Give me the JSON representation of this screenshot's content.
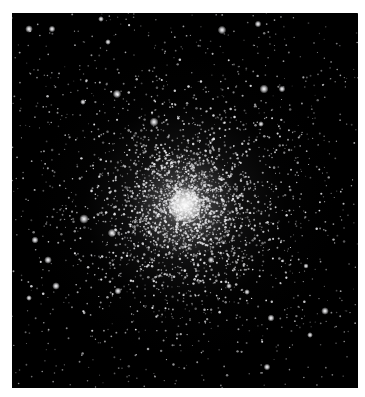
{
  "image": {
    "subject": "Globular star cluster",
    "description": "Dense spherical cluster of stars on a black sky, bright concentrated core with stars thinning toward the edges",
    "frame": {
      "x": 12,
      "y": 13,
      "width": 346,
      "height": 375
    },
    "background_color": "#ffffff",
    "sky_color": "#000000",
    "core_center": {
      "x": 185,
      "y": 205
    },
    "core_color": "#ffffff",
    "star_color": "#e8e8ea"
  },
  "bright_stars": [
    {
      "x": 29,
      "y": 29,
      "r": 1.6
    },
    {
      "x": 52,
      "y": 29,
      "r": 1.4
    },
    {
      "x": 101,
      "y": 19,
      "r": 1.2
    },
    {
      "x": 117,
      "y": 94,
      "r": 1.8
    },
    {
      "x": 108,
      "y": 42,
      "r": 1.2
    },
    {
      "x": 83,
      "y": 102,
      "r": 1.2
    },
    {
      "x": 154,
      "y": 122,
      "r": 1.9
    },
    {
      "x": 84,
      "y": 219,
      "r": 2.0
    },
    {
      "x": 112,
      "y": 233,
      "r": 1.8
    },
    {
      "x": 35,
      "y": 240,
      "r": 1.5
    },
    {
      "x": 48,
      "y": 260,
      "r": 1.6
    },
    {
      "x": 56,
      "y": 286,
      "r": 1.6
    },
    {
      "x": 29,
      "y": 298,
      "r": 1.2
    },
    {
      "x": 118,
      "y": 291,
      "r": 1.5
    },
    {
      "x": 264,
      "y": 89,
      "r": 1.9
    },
    {
      "x": 282,
      "y": 89,
      "r": 1.4
    },
    {
      "x": 261,
      "y": 124,
      "r": 1.2
    },
    {
      "x": 325,
      "y": 311,
      "r": 1.6
    },
    {
      "x": 271,
      "y": 318,
      "r": 1.5
    },
    {
      "x": 267,
      "y": 367,
      "r": 1.4
    },
    {
      "x": 211,
      "y": 260,
      "r": 1.4
    },
    {
      "x": 229,
      "y": 286,
      "r": 1.2
    },
    {
      "x": 247,
      "y": 292,
      "r": 1.2
    },
    {
      "x": 306,
      "y": 266,
      "r": 1.1
    },
    {
      "x": 310,
      "y": 335,
      "r": 1.2
    },
    {
      "x": 222,
      "y": 30,
      "r": 1.8
    },
    {
      "x": 258,
      "y": 24,
      "r": 1.4
    }
  ],
  "field": {
    "seed": 20240,
    "scatter_count": 900,
    "cluster_count": 2600,
    "cluster_spread": 48
  }
}
